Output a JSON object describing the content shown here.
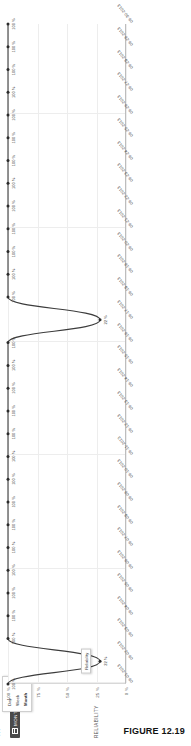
{
  "figure": {
    "caption": "FIGURE 12.19"
  },
  "granularity": {
    "selected_label": "MONTH",
    "icon": "calendar-icon",
    "overflow_icon": "ellipsis-icon",
    "options": [
      {
        "label": "Day"
      },
      {
        "label": "Week"
      },
      {
        "label": "Month"
      }
    ]
  },
  "tooltip": {
    "text": "Reliability"
  },
  "chart_data": {
    "type": "line",
    "title": "",
    "xlabel": "",
    "ylabel": "RELIABILITY",
    "ylim": [
      0,
      100
    ],
    "grid": true,
    "legend": "none",
    "ytick_labels": [
      "100 %",
      "75 %",
      "50 %",
      "25 %",
      "0 %"
    ],
    "ytick_values": [
      100,
      75,
      50,
      25,
      0
    ],
    "categories": [
      "06-01-2013",
      "06-02-2013",
      "06-03-2013",
      "06-04-2013",
      "06-05-2013",
      "06-06-2013",
      "06-07-2013",
      "06-08-2013",
      "06-09-2013",
      "06-10-2013",
      "06-11-2013",
      "06-12-2013",
      "06-13-2013",
      "06-14-2013",
      "06-15-2013",
      "06-16-2013",
      "06-17-2013",
      "06-18-2013",
      "06-19-2013",
      "06-20-2013",
      "06-21-2013",
      "06-22-2013",
      "06-23-2013",
      "06-24-2013",
      "06-25-2013",
      "06-26-2013",
      "06-27-2013",
      "06-28-2013",
      "06-29-2013",
      "06-30-2013"
    ],
    "values": [
      100,
      22,
      100,
      100,
      100,
      100,
      100,
      100,
      100,
      100,
      100,
      100,
      100,
      100,
      100,
      100,
      22,
      100,
      100,
      100,
      100,
      100,
      100,
      100,
      100,
      100,
      100,
      100,
      100,
      100
    ],
    "point_labels": [
      "100 %",
      "22 %",
      "100 %",
      "100 %",
      "100 %",
      "100 %",
      "100 %",
      "100 %",
      "100 %",
      "100 %",
      "100 %",
      "100 %",
      "100 %",
      "100 %",
      "100 %",
      "100 %",
      "22 %",
      "100 %",
      "100 %",
      "100 %",
      "100 %",
      "100 %",
      "100 %",
      "100 %",
      "100 %",
      "100 %",
      "100 %",
      "100 %",
      "100 %",
      "100 %"
    ],
    "series_color": "#3c3c3c",
    "marker_color": "#2b2b2b"
  }
}
